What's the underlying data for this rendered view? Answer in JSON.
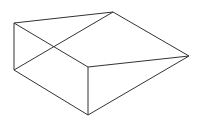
{
  "diagram": {
    "type": "wireframe-solid",
    "stroke_color": "#333333",
    "stroke_width": 1,
    "vertices": {
      "A": [
        14,
        23
      ],
      "B": [
        113,
        12
      ],
      "C": [
        189,
        56
      ],
      "D": [
        88,
        67
      ],
      "E": [
        14,
        70
      ],
      "F": [
        88,
        115
      ]
    },
    "edges": [
      [
        "A",
        "B"
      ],
      [
        "A",
        "E"
      ],
      [
        "A",
        "D"
      ],
      [
        "E",
        "B"
      ],
      [
        "E",
        "F"
      ],
      [
        "B",
        "C"
      ],
      [
        "D",
        "C"
      ],
      [
        "D",
        "F"
      ],
      [
        "F",
        "C"
      ]
    ]
  },
  "caption": ""
}
